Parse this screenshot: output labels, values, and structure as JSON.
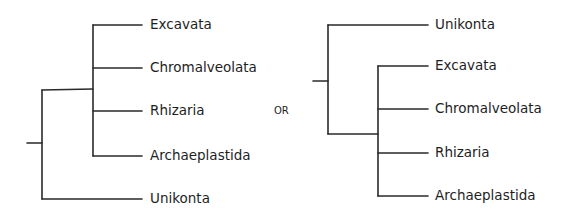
{
  "diagram": {
    "type": "phylogenetic-tree-comparison",
    "connector_label": "OR",
    "trees": [
      {
        "id": "left",
        "description": "Unikonta as outgroup; four other supergroups form a polytomy",
        "root_stub": {
          "x1": 27,
          "x2": 42,
          "y": 143
        },
        "outer_vertical": {
          "x": 42,
          "y1": 90,
          "y2": 199
        },
        "inner_vertical": {
          "x": 93,
          "y1": 25,
          "y2": 156
        },
        "inner_join_y": 90,
        "tip_x": 142,
        "leaves": [
          {
            "label": "Excavata",
            "y": 25,
            "from_x": 93
          },
          {
            "label": "Chromalveolata",
            "y": 68,
            "from_x": 93
          },
          {
            "label": "Rhizaria",
            "y": 111,
            "from_x": 93
          },
          {
            "label": "Archaeplastida",
            "y": 156,
            "from_x": 93
          },
          {
            "label": "Unikonta",
            "y": 199,
            "from_x": 42
          }
        ]
      },
      {
        "id": "right",
        "description": "Unikonta as outgroup drawn on top; four other supergroups form a polytomy",
        "root_stub": {
          "x1": 313,
          "x2": 328,
          "y": 81
        },
        "outer_vertical": {
          "x": 328,
          "y1": 25,
          "y2": 134
        },
        "inner_vertical": {
          "x": 378,
          "y1": 66,
          "y2": 196
        },
        "inner_join_y": 134,
        "tip_x": 428,
        "leaves": [
          {
            "label": "Unikonta",
            "y": 25,
            "from_x": 328
          },
          {
            "label": "Excavata",
            "y": 66,
            "from_x": 378
          },
          {
            "label": "Chromalveolata",
            "y": 109,
            "from_x": 378
          },
          {
            "label": "Rhizaria",
            "y": 153,
            "from_x": 378
          },
          {
            "label": "Archaeplastida",
            "y": 196,
            "from_x": 378
          }
        ]
      }
    ]
  }
}
